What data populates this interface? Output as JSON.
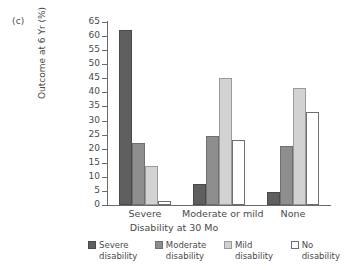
{
  "panel": {
    "label": "(c)"
  },
  "chart_data": {
    "type": "bar",
    "title": "",
    "subtitle": "",
    "xlabel": "Disability at 30 Mo",
    "ylabel": "Outcome at 6 Yr (%)",
    "categories": [
      "Severe",
      "Moderate or mild",
      "None"
    ],
    "series": [
      {
        "name": "Severe disability",
        "color": "#5f5f5f",
        "values": [
          62,
          7.5,
          4.5
        ]
      },
      {
        "name": "Moderate disability",
        "color": "#8e8e8e",
        "values": [
          22,
          24.5,
          21
        ]
      },
      {
        "name": "Mild disability",
        "color": "#d2d2d2",
        "values": [
          14,
          45,
          41.5
        ]
      },
      {
        "name": "No disability",
        "color": "#ffffff",
        "values": [
          1.5,
          23,
          33
        ]
      }
    ],
    "ylim": [
      0,
      65
    ],
    "ytick_step": 5,
    "ytick_labels": [
      "0",
      "5",
      "10",
      "15",
      "20",
      "25",
      "30",
      "35",
      "40",
      "45",
      "50",
      "55",
      "60",
      "65"
    ],
    "grid": false,
    "legend_position": "bottom",
    "axis_color": "#6b6b6b",
    "text_color": "#4a4a4a",
    "background": "#ffffff"
  },
  "legend": {
    "items": [
      {
        "line1": "Severe",
        "line2": "disability"
      },
      {
        "line1": "Moderate",
        "line2": "disability"
      },
      {
        "line1": "Mild",
        "line2": "disability"
      },
      {
        "line1": "No",
        "line2": "disability"
      }
    ]
  }
}
